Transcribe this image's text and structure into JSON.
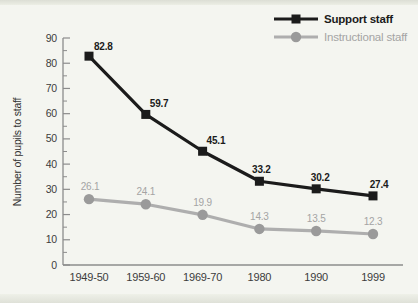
{
  "page": {
    "background_color": "#f4f5f0",
    "top_band_color": "#dcded5",
    "bottom_band_color": "#dfe1d8"
  },
  "chart_data": {
    "type": "line",
    "title": "",
    "xlabel": "",
    "ylabel": "Number of pupils to staff",
    "categories": [
      "1949-50",
      "1959-60",
      "1969-70",
      "1980",
      "1990",
      "1999"
    ],
    "series": [
      {
        "name": "Support staff",
        "values": [
          82.8,
          59.7,
          45.1,
          33.2,
          30.2,
          27.4
        ],
        "color": "#1b1b1b",
        "marker": "square",
        "marker_color": "#1b1b1b",
        "value_label_color": "#1b1b1b"
      },
      {
        "name": "Instructional staff",
        "values": [
          26.1,
          24.1,
          19.9,
          14.3,
          13.5,
          12.3
        ],
        "color": "#aeaeae",
        "marker": "circle",
        "marker_color": "#9a9a9a",
        "value_label_color": "#a4a4a4"
      }
    ],
    "ylim": [
      0,
      90
    ],
    "y_ticks": [
      0,
      10,
      20,
      30,
      40,
      50,
      60,
      70,
      80,
      90
    ],
    "y_minor_step": 5,
    "grid": false,
    "legend_position": "top-right",
    "axis_color": "#8c8c8c",
    "tick_label_color": "#3c3c3c"
  }
}
